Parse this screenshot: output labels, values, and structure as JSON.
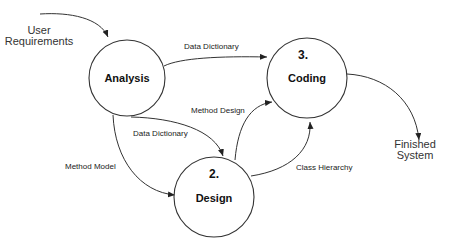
{
  "diagram": {
    "type": "data-flow",
    "colors": {
      "stroke": "#333333",
      "text": "#222222",
      "background": "#ffffff"
    },
    "nodes": [
      {
        "id": "analysis",
        "number": "",
        "label": "Analysis"
      },
      {
        "id": "design",
        "number": "2.",
        "label": "Design"
      },
      {
        "id": "coding",
        "number": "3.",
        "label": "Coding"
      }
    ],
    "externals": {
      "input": {
        "line1": "User",
        "line2": "Requirements"
      },
      "output": {
        "line1": "Finished",
        "line2": "System"
      }
    },
    "edges": [
      {
        "from": "input",
        "to": "analysis",
        "label": ""
      },
      {
        "from": "analysis",
        "to": "coding",
        "label": "Data Dictionary"
      },
      {
        "from": "analysis",
        "to": "design",
        "label": "Data Dictionary"
      },
      {
        "from": "analysis",
        "to": "design",
        "label": "Method Model"
      },
      {
        "from": "design",
        "to": "coding",
        "label": "Method Design"
      },
      {
        "from": "design",
        "to": "coding",
        "label": "Class Hierarchy"
      },
      {
        "from": "coding",
        "to": "output",
        "label": ""
      }
    ]
  }
}
